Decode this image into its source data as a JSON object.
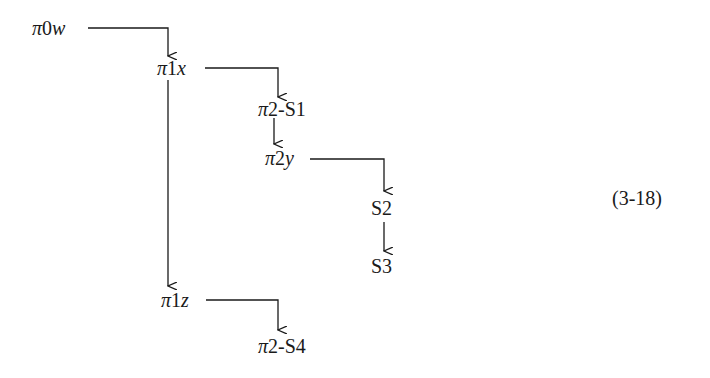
{
  "diagram": {
    "type": "tree",
    "equation_label": "(3-18)",
    "nodes": [
      {
        "id": "pi0w",
        "label": "π0w",
        "pi": "π",
        "num": "0",
        "var": "w"
      },
      {
        "id": "pi1x",
        "label": "π1x",
        "pi": "π",
        "num": "1",
        "var": "x"
      },
      {
        "id": "pi2S1",
        "label": "π2-S1",
        "pi": "π",
        "rest": "2-S1"
      },
      {
        "id": "pi2y",
        "label": "π2y",
        "pi": "π",
        "num": "2",
        "var": "y"
      },
      {
        "id": "S2",
        "label": "S2"
      },
      {
        "id": "S3",
        "label": "S3"
      },
      {
        "id": "pi1z",
        "label": "π1z",
        "pi": "π",
        "num": "1",
        "var": "z"
      },
      {
        "id": "pi2S4",
        "label": "π2-S4",
        "pi": "π",
        "rest": "2-S4"
      }
    ],
    "edges": [
      {
        "from": "pi0w",
        "to": "pi1x"
      },
      {
        "from": "pi1x",
        "to": "pi2S1"
      },
      {
        "from": "pi1x",
        "to": "pi1z"
      },
      {
        "from": "pi2S1",
        "to": "pi2y"
      },
      {
        "from": "pi2y",
        "to": "S2"
      },
      {
        "from": "S2",
        "to": "S3"
      },
      {
        "from": "pi1z",
        "to": "pi2S4"
      }
    ]
  }
}
